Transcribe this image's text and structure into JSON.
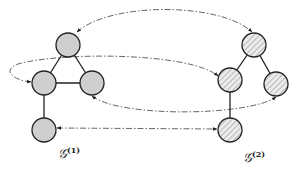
{
  "diagram": {
    "type": "graph-correspondence",
    "graphs": [
      {
        "id": "g1",
        "label_main": "𝒢",
        "label_sup": "(1)",
        "node_style": "gray-filled",
        "fill_color": "#cfcfcf",
        "nodes": [
          {
            "id": "g1-top",
            "x": 68,
            "y": 45
          },
          {
            "id": "g1-left",
            "x": 44,
            "y": 83
          },
          {
            "id": "g1-right",
            "x": 92,
            "y": 83
          },
          {
            "id": "g1-bottom",
            "x": 44,
            "y": 130
          }
        ],
        "edges": [
          [
            "g1-top",
            "g1-left"
          ],
          [
            "g1-top",
            "g1-right"
          ],
          [
            "g1-left",
            "g1-right"
          ],
          [
            "g1-left",
            "g1-bottom"
          ]
        ]
      },
      {
        "id": "g2",
        "label_main": "𝒢",
        "label_sup": "(2)",
        "node_style": "hatched",
        "fill_color": "#e6e6e6",
        "nodes": [
          {
            "id": "g2-top",
            "x": 254,
            "y": 45
          },
          {
            "id": "g2-left",
            "x": 230,
            "y": 80
          },
          {
            "id": "g2-right",
            "x": 276,
            "y": 84
          },
          {
            "id": "g2-bottom",
            "x": 230,
            "y": 130
          }
        ],
        "edges": [
          [
            "g2-top",
            "g2-left"
          ],
          [
            "g2-top",
            "g2-right"
          ],
          [
            "g2-left",
            "g2-bottom"
          ]
        ]
      }
    ],
    "correspondences": [
      {
        "from": "g1-top",
        "to": "g2-top",
        "style": "dash-dot",
        "bidirectional": true
      },
      {
        "from": "g1-left",
        "to": "g2-left",
        "style": "dash-dot",
        "bidirectional": true
      },
      {
        "from": "g1-right",
        "to": "g2-right",
        "style": "dash-dot",
        "bidirectional": true
      },
      {
        "from": "g1-bottom",
        "to": "g2-bottom",
        "style": "dash-dot",
        "bidirectional": true
      }
    ],
    "labels": {
      "g1": "𝒢",
      "g1_sup": "(1)",
      "g2": "𝒢",
      "g2_sup": "(2)"
    }
  }
}
